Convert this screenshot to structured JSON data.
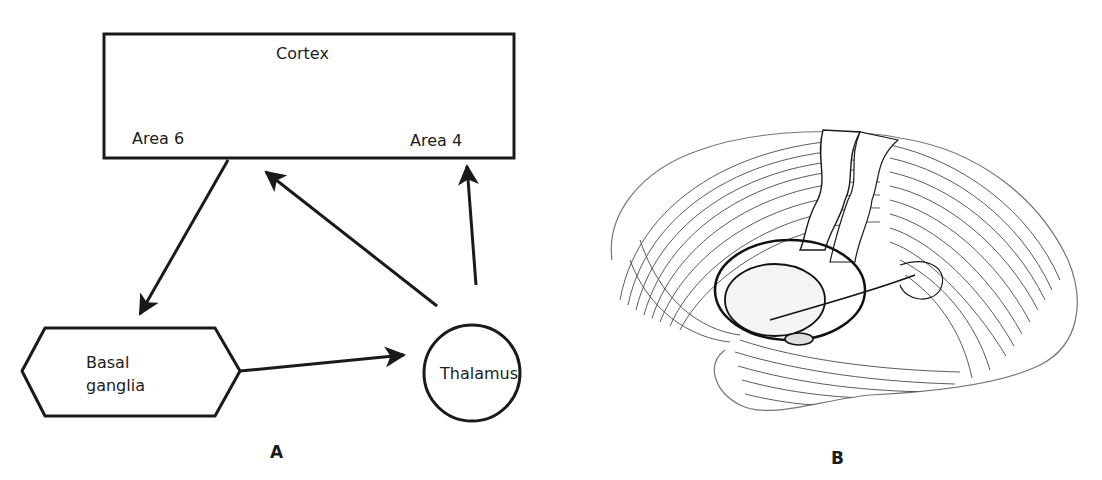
{
  "figure": {
    "panel_a": {
      "label": "A",
      "nodes": {
        "cortex": {
          "title": "Cortex",
          "area_left": "Area 6",
          "area_right": "Area 4"
        },
        "basal_ganglia": {
          "line1": "Basal",
          "line2": "ganglia"
        },
        "thalamus": {
          "title": "Thalamus"
        }
      },
      "edges": [
        {
          "from": "Cortex (Area 6)",
          "to": "Basal ganglia"
        },
        {
          "from": "Basal ganglia",
          "to": "Thalamus"
        },
        {
          "from": "Thalamus",
          "to": "Cortex (Area 6)"
        },
        {
          "from": "Thalamus",
          "to": "Cortex (Area 4)"
        }
      ]
    },
    "panel_b": {
      "label": "B",
      "illustration": "lateral-view-brain-hemisphere-engraving"
    },
    "colors": {
      "ink": "#1a1a1a",
      "background": "#ffffff"
    }
  }
}
